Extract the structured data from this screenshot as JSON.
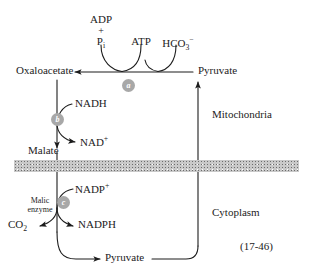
{
  "figure": {
    "reference": "(17-46)",
    "compartments": {
      "upper": "Mitochondria",
      "lower": "Cytoplasm"
    },
    "metabolites": {
      "oxaloacetate": "Oxaloacetate",
      "pyruvate_top": "Pyruvate",
      "pyruvate_bottom": "Pyruvate",
      "malate": "Malate",
      "co2": "CO",
      "co2_sub": "2"
    },
    "cofactors": {
      "adp": "ADP",
      "plus": "+",
      "pi": "P",
      "pi_sub": "i",
      "atp": "ATP",
      "bicarbonate": "HCO",
      "bicarbonate_sub": "3",
      "bicarbonate_sup": "−",
      "nadh": "NADH",
      "nad_plus": "NAD",
      "nad_sup": "+",
      "nadp_plus": "NADP",
      "nadp_sup": "+",
      "nadph": "NADPH"
    },
    "enzymes": {
      "a": "a",
      "b": "b",
      "c": "c",
      "malic_enzyme_line1": "Malic",
      "malic_enzyme_line2": "enzyme"
    },
    "colors": {
      "stroke": "#1c1c1c",
      "enzyme_circle": "#a8a8a8",
      "enzyme_letter": "#ffffff",
      "membrane": "#c9c9c9",
      "background": "#ffffff"
    }
  }
}
